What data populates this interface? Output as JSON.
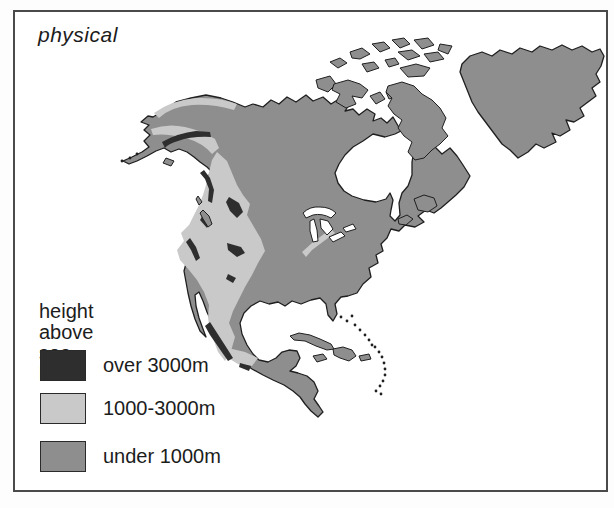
{
  "map_figure": {
    "title": "physical",
    "region": "North America",
    "legend": {
      "title_line1": "height above",
      "title_line2": "sea level",
      "items": [
        {
          "id": "over-3000m",
          "label": "over 3000m",
          "color": "#2e2e2e"
        },
        {
          "id": "1000-3000m",
          "label": "1000-3000m",
          "color": "#c9c9c9"
        },
        {
          "id": "under-1000m",
          "label": "under 1000m",
          "color": "#8e8e8e"
        }
      ]
    },
    "colors": {
      "land_under_1000m": "#8e8e8e",
      "elev_1000_3000m": "#c9c9c9",
      "elev_over_3000m": "#2e2e2e",
      "water": "#ffffff",
      "outline": "#1f1f1f",
      "frame_border": "#4a4a4a",
      "text": "#1c1c1c"
    }
  }
}
